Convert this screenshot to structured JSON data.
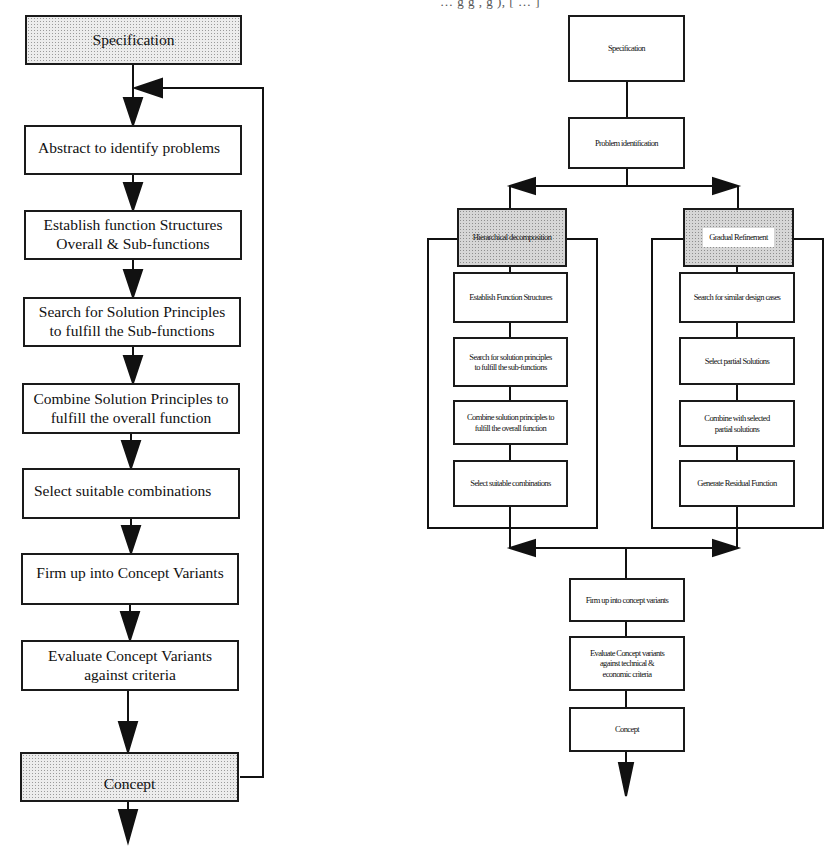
{
  "header_fragment": "… g  g  , g  ),  [ … ]",
  "left_diagram": {
    "title": "Systematic design process (linear)",
    "steps": [
      {
        "label": "Specification",
        "style": "dotted"
      },
      {
        "label": "Abstract to identify problems",
        "style": "plain"
      },
      {
        "label": "Establish function Structures\nOverall & Sub-functions",
        "style": "plain"
      },
      {
        "label": "Search for Solution Principles\nto fulfill the Sub-functions",
        "style": "plain"
      },
      {
        "label": "Combine Solution Principles to\nfulfill the overall function",
        "style": "plain"
      },
      {
        "label": "Select suitable combinations",
        "style": "plain"
      },
      {
        "label": "Firm up into Concept Variants",
        "style": "plain"
      },
      {
        "label": "Evaluate Concept Variants\nagainst criteria",
        "style": "plain"
      },
      {
        "label": "Concept",
        "style": "dotted"
      }
    ],
    "feedback_loop": {
      "from": "Concept",
      "to": "Abstract to identify problems"
    }
  },
  "right_diagram": {
    "title": "Combined design process with parallel branches",
    "top": [
      {
        "label": "Specification"
      },
      {
        "label": "Problem identification"
      }
    ],
    "branches": [
      {
        "header": "Hierarchical decomposition",
        "steps": [
          "Establish Function Structures",
          "Search for solution principles\nto fulfill the sub-functions",
          "Combine solution principles to\nfulfill the overall function",
          "Select suitable combinations"
        ]
      },
      {
        "header": "Gradual Refinement",
        "steps": [
          "Search for similar design cases",
          "Select partial Solutions",
          "Combine with selected\npartial solutions",
          "Generate Residual Function"
        ]
      }
    ],
    "bottom": [
      {
        "label": "Firm up into concept variants"
      },
      {
        "label": "Evaluate Concept variants\nagainst technical &\neconomic criteria"
      },
      {
        "label": "Concept"
      }
    ]
  }
}
